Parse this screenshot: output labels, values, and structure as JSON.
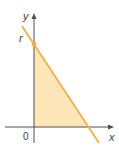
{
  "diagram": {
    "type": "coordinate-plot",
    "labels": {
      "y_axis": "y",
      "x_axis": "x",
      "origin": "0",
      "intercept": "r"
    },
    "colors": {
      "axis": "#4a4f57",
      "line": "#f0b050",
      "fill": "#fde6b8",
      "point": "#f0b050",
      "text": "#3a3f46"
    }
  }
}
